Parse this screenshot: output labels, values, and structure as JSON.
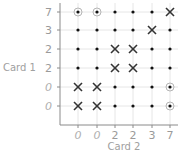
{
  "chart_data": {
    "type": "scatter",
    "title": "",
    "xlabel": "Card 2",
    "ylabel": "Card 1",
    "x_ticks": [
      "0",
      "0",
      "2",
      "2",
      "3",
      "7"
    ],
    "y_ticks_top_to_bottom": [
      "7",
      "3",
      "2",
      "2",
      "0",
      "0"
    ],
    "grid": true,
    "marks": [
      [
        "circle",
        "circle",
        "dot",
        "dot",
        "dot",
        "x"
      ],
      [
        "dot",
        "dot",
        "dot",
        "dot",
        "x",
        "dot"
      ],
      [
        "dot",
        "dot",
        "x",
        "x",
        "dot",
        "dot"
      ],
      [
        "dot",
        "dot",
        "x",
        "x",
        "dot",
        "dot"
      ],
      [
        "x",
        "x",
        "dot",
        "dot",
        "dot",
        "circle"
      ],
      [
        "x",
        "x",
        "dot",
        "dot",
        "dot",
        "circle"
      ]
    ],
    "colors": {
      "axis": "#8a8a8a",
      "grid": "#e6e6e6",
      "dot": "#111111",
      "x_mark": "#333333",
      "circle": "#b5b5b5",
      "tick_text": "#9a9a9a"
    }
  }
}
